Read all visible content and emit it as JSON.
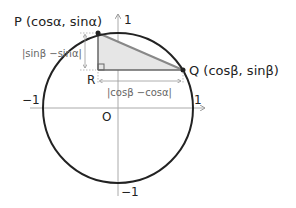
{
  "diagram": {
    "type": "unit-circle-distance",
    "labels": {
      "P": "P (cosα,  sinα)",
      "Q": "Q (cosβ,  sinβ)",
      "R": "R",
      "O": "O",
      "y_top": "1",
      "x_right": "1",
      "x_left": "−1",
      "y_bottom": "−1",
      "vertical_distance": "|sinβ −sinα|",
      "horizontal_distance": "|cosβ −cosα|"
    },
    "points": {
      "P": [
        98,
        33
      ],
      "Q": [
        183,
        70
      ],
      "R": [
        98,
        70
      ],
      "O": [
        118,
        108
      ]
    },
    "colors": {
      "circle": "#222222",
      "axis": "#aaaaaa",
      "triangle_fill": "#e6e6e6",
      "hypotenuse": "#888888",
      "legs": "#666666",
      "dim_arrow": "#999999"
    }
  }
}
